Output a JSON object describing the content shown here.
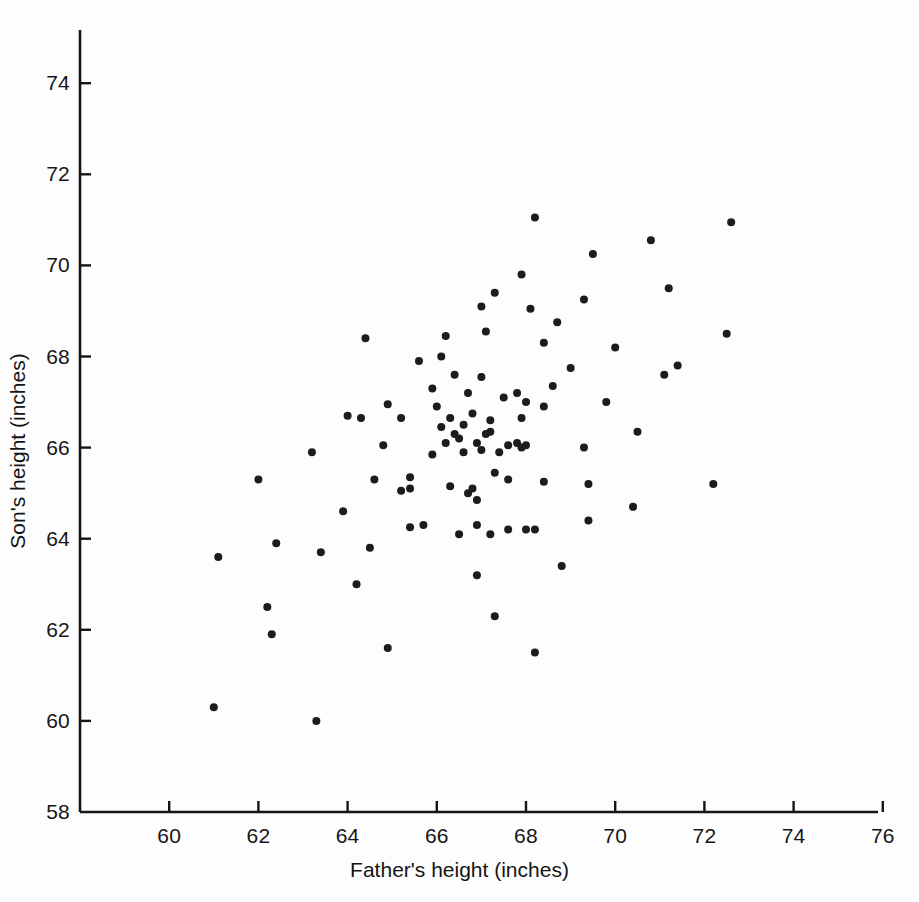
{
  "chart_data": {
    "type": "scatter",
    "title": "",
    "xlabel": "Father's height (inches)",
    "ylabel": "Son's height (inches)",
    "xlim": [
      58,
      76
    ],
    "ylim": [
      58,
      75
    ],
    "xticks": [
      60,
      62,
      64,
      66,
      68,
      70,
      72,
      74,
      76
    ],
    "xtick_labels": [
      "60",
      "62",
      "64",
      "66",
      "68",
      "70",
      "72",
      "74",
      "76"
    ],
    "yticks": [
      58,
      60,
      62,
      64,
      66,
      68,
      70,
      72,
      74
    ],
    "ytick_labels": [
      "58",
      "60",
      "62",
      "64",
      "66",
      "68",
      "70",
      "72",
      "74"
    ],
    "grid": false,
    "legend": null,
    "marker": {
      "shape": "circle",
      "color": "#1c1c1c",
      "size_px": 8
    },
    "axis_color": "#151515",
    "background": "#fdfdfd",
    "n_points": 100,
    "series": [
      {
        "name": "father-son heights",
        "points": [
          [
            61.0,
            60.3
          ],
          [
            63.3,
            60.0
          ],
          [
            62.3,
            61.9
          ],
          [
            64.9,
            61.6
          ],
          [
            68.2,
            61.5
          ],
          [
            62.2,
            62.5
          ],
          [
            67.3,
            62.3
          ],
          [
            64.2,
            63.0
          ],
          [
            66.9,
            63.2
          ],
          [
            68.8,
            63.4
          ],
          [
            61.1,
            63.6
          ],
          [
            63.4,
            63.7
          ],
          [
            64.5,
            63.8
          ],
          [
            62.4,
            63.9
          ],
          [
            66.5,
            64.1
          ],
          [
            67.2,
            64.1
          ],
          [
            67.6,
            64.2
          ],
          [
            65.4,
            64.25
          ],
          [
            68.2,
            64.2
          ],
          [
            69.4,
            64.4
          ],
          [
            63.9,
            64.6
          ],
          [
            66.9,
            64.85
          ],
          [
            70.4,
            64.7
          ],
          [
            65.4,
            65.1
          ],
          [
            66.8,
            65.1
          ],
          [
            66.3,
            65.15
          ],
          [
            72.2,
            65.2
          ],
          [
            69.4,
            65.2
          ],
          [
            62.0,
            65.3
          ],
          [
            64.6,
            65.3
          ],
          [
            65.4,
            65.35
          ],
          [
            67.6,
            65.3
          ],
          [
            68.4,
            65.25
          ],
          [
            67.3,
            65.45
          ],
          [
            63.2,
            65.9
          ],
          [
            65.9,
            65.85
          ],
          [
            66.6,
            65.9
          ],
          [
            67.0,
            65.95
          ],
          [
            67.4,
            65.9
          ],
          [
            68.0,
            66.05
          ],
          [
            64.8,
            66.05
          ],
          [
            66.2,
            66.1
          ],
          [
            66.9,
            66.1
          ],
          [
            67.8,
            66.1
          ],
          [
            69.3,
            66.0
          ],
          [
            66.4,
            66.3
          ],
          [
            67.1,
            66.3
          ],
          [
            70.5,
            66.35
          ],
          [
            66.1,
            66.45
          ],
          [
            66.6,
            66.5
          ],
          [
            66.3,
            66.65
          ],
          [
            67.2,
            66.6
          ],
          [
            67.9,
            66.65
          ],
          [
            65.2,
            66.65
          ],
          [
            66.8,
            66.75
          ],
          [
            64.3,
            66.65
          ],
          [
            68.4,
            66.9
          ],
          [
            69.8,
            67.0
          ],
          [
            64.9,
            66.95
          ],
          [
            66.0,
            66.9
          ],
          [
            67.5,
            67.1
          ],
          [
            67.8,
            67.2
          ],
          [
            66.7,
            67.2
          ],
          [
            65.9,
            67.3
          ],
          [
            68.6,
            67.35
          ],
          [
            71.1,
            67.6
          ],
          [
            64.0,
            66.7
          ],
          [
            66.4,
            67.6
          ],
          [
            67.0,
            67.55
          ],
          [
            69.0,
            67.75
          ],
          [
            71.4,
            67.8
          ],
          [
            65.6,
            67.9
          ],
          [
            66.1,
            68.0
          ],
          [
            70.0,
            68.2
          ],
          [
            68.4,
            68.3
          ],
          [
            66.2,
            68.45
          ],
          [
            64.4,
            68.4
          ],
          [
            67.1,
            68.55
          ],
          [
            68.7,
            68.75
          ],
          [
            67.0,
            69.1
          ],
          [
            68.1,
            69.05
          ],
          [
            69.3,
            69.25
          ],
          [
            67.3,
            69.4
          ],
          [
            71.2,
            69.5
          ],
          [
            67.9,
            69.8
          ],
          [
            69.5,
            70.25
          ],
          [
            70.8,
            70.55
          ],
          [
            68.2,
            71.05
          ],
          [
            72.6,
            70.95
          ],
          [
            72.5,
            68.5
          ],
          [
            65.2,
            65.05
          ],
          [
            66.7,
            65.0
          ],
          [
            66.9,
            64.3
          ],
          [
            68.0,
            64.2
          ],
          [
            65.7,
            64.3
          ],
          [
            67.9,
            66.0
          ],
          [
            67.6,
            66.05
          ],
          [
            66.5,
            66.2
          ],
          [
            67.2,
            66.35
          ],
          [
            68.0,
            67.0
          ]
        ]
      }
    ]
  },
  "axes_geometry": {
    "plot_left_px": 80,
    "plot_bottom_px": 812,
    "px_per_inch_x": 44.6,
    "px_per_inch_y": 45.55,
    "y_axis_top_px": 30,
    "x_axis_right_px": 878
  }
}
